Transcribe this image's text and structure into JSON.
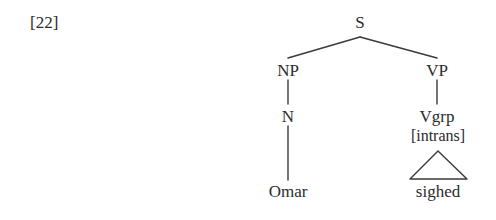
{
  "diagram": {
    "type": "constituency-syntax-tree",
    "example_number": "[22]",
    "sentence": "Omar sighed",
    "background_color": "#ffffff",
    "line_color": "#3a3a3a",
    "text_color": "#2b2b2b",
    "nodes": {
      "root": {
        "label": "S",
        "x": 360,
        "y": 22
      },
      "np": {
        "label": "NP",
        "x": 288,
        "y": 70
      },
      "vp": {
        "label": "VP",
        "x": 437,
        "y": 70
      },
      "n": {
        "label": "N",
        "x": 288,
        "y": 116
      },
      "vgrp": {
        "label": "Vgrp",
        "x": 437,
        "y": 116
      },
      "vgrp_feature": {
        "label": "[intrans]",
        "x": 438,
        "y": 136
      },
      "omar": {
        "label": "Omar",
        "x": 288,
        "y": 191
      },
      "sighed": {
        "label": "sighed",
        "x": 438,
        "y": 191
      }
    },
    "edges": [
      {
        "name": "s-to-np",
        "x1": 360,
        "y1": 37,
        "x2": 288,
        "y2": 58
      },
      {
        "name": "s-to-vp",
        "x1": 360,
        "y1": 37,
        "x2": 437,
        "y2": 58
      },
      {
        "name": "np-to-n",
        "x1": 288,
        "y1": 80,
        "x2": 288,
        "y2": 104
      },
      {
        "name": "vp-to-vgrp",
        "x1": 437,
        "y1": 80,
        "x2": 437,
        "y2": 104
      },
      {
        "name": "n-to-omar",
        "x1": 288,
        "y1": 126,
        "x2": 288,
        "y2": 180
      }
    ],
    "triangle": {
      "name": "sighed-triangle",
      "apex_x": 438,
      "apex_y": 151,
      "left_x": 410,
      "right_x": 467,
      "base_y": 179
    }
  }
}
